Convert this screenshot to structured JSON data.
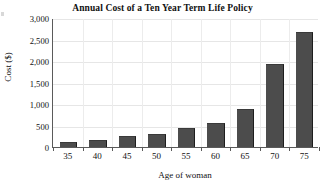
{
  "chart_data": {
    "type": "bar",
    "title": "Annual Cost of a Ten Year Term Life Policy",
    "xlabel": "Age of woman",
    "ylabel": "Cost ($)",
    "categories": [
      "35",
      "40",
      "45",
      "50",
      "55",
      "60",
      "65",
      "70",
      "75"
    ],
    "values": [
      100,
      150,
      240,
      290,
      420,
      540,
      870,
      1910,
      2650
    ],
    "ylim": [
      0,
      3000
    ],
    "yticks": [
      0,
      500,
      1000,
      1500,
      2000,
      2500,
      3000
    ],
    "ytick_labels": [
      "0",
      "500",
      "1,000",
      "1,500",
      "2,000",
      "2,500",
      "3,000"
    ],
    "grid": true,
    "legend": "none",
    "bar_color": "#4c4c4c",
    "gridline_color": "#e6e6e6",
    "axis_color": "#5a5a5a",
    "background_color": "#ffffff"
  }
}
